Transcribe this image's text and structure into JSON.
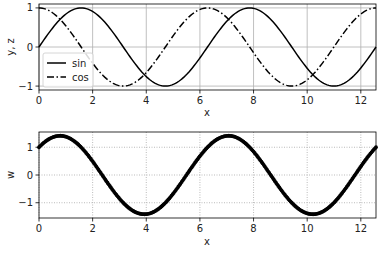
{
  "chart_data": [
    {
      "type": "line",
      "title": "",
      "xlabel": "x",
      "ylabel": "y, z",
      "xlim": [
        0,
        12.566
      ],
      "ylim": [
        -1.1,
        1.1
      ],
      "xticks": [
        0,
        2,
        4,
        6,
        8,
        10,
        12
      ],
      "yticks": [
        -1,
        0,
        1
      ],
      "grid": true,
      "grid_style": "solid",
      "legend_position": "lower left",
      "series": [
        {
          "name": "sin",
          "style": "solid",
          "function": "sin(x)",
          "x": [
            0,
            1.571,
            3.142,
            4.712,
            6.283,
            7.854,
            9.425,
            10.996,
            12.566
          ],
          "values": [
            0,
            1,
            0,
            -1,
            0,
            1,
            0,
            -1,
            0
          ]
        },
        {
          "name": "cos",
          "style": "dashdot",
          "function": "cos(x)",
          "x": [
            0,
            1.571,
            3.142,
            4.712,
            6.283,
            7.854,
            9.425,
            10.996,
            12.566
          ],
          "values": [
            1,
            0,
            -1,
            0,
            1,
            0,
            -1,
            0,
            1
          ]
        }
      ]
    },
    {
      "type": "line",
      "title": "",
      "xlabel": "x",
      "ylabel": "w",
      "xlim": [
        0,
        12.566
      ],
      "ylim": [
        -1.55,
        1.55
      ],
      "xticks": [
        0,
        2,
        4,
        6,
        8,
        10,
        12
      ],
      "yticks": [
        -1,
        0,
        1
      ],
      "grid": true,
      "grid_style": "dotted",
      "series": [
        {
          "name": "w",
          "style": "markers",
          "function": "sin(x)+cos(x)",
          "x": [
            0,
            0.785,
            2.356,
            3.927,
            5.498,
            7.069,
            8.639,
            10.21,
            11.781,
            12.566
          ],
          "values": [
            1,
            1.414,
            0,
            -1.414,
            0,
            1.414,
            0,
            -1.414,
            0,
            1
          ]
        }
      ]
    }
  ],
  "legend": {
    "items": [
      {
        "label": "sin"
      },
      {
        "label": "cos"
      }
    ]
  },
  "axes": {
    "top": {
      "xlabel": "x",
      "ylabel": "y, z",
      "xtick_labels": [
        "0",
        "2",
        "4",
        "6",
        "8",
        "10",
        "12"
      ],
      "ytick_labels": [
        "1",
        "0",
        "−1"
      ]
    },
    "bottom": {
      "xlabel": "x",
      "ylabel": "w",
      "xtick_labels": [
        "0",
        "2",
        "4",
        "6",
        "8",
        "10",
        "12"
      ],
      "ytick_labels": [
        "1",
        "0",
        "−1"
      ]
    }
  }
}
